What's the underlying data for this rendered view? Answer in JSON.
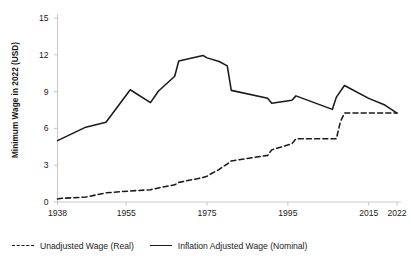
{
  "chart_data": {
    "type": "line",
    "title": "",
    "subtitle": "",
    "xlabel": "",
    "ylabel": "Minimum Wage in 2022 (USD)",
    "xlim": [
      1938,
      2022
    ],
    "ylim": [
      0,
      15
    ],
    "grid": false,
    "legend_position": "bottom-left",
    "x_tick_labels": [
      "1938",
      "1955",
      "1975",
      "1995",
      "2015",
      "2022"
    ],
    "x_tick_values": [
      1938,
      1955,
      1975,
      1995,
      2015,
      2022
    ],
    "y_tick_labels": [
      "0",
      "3",
      "6",
      "9",
      "12",
      "15"
    ],
    "y_tick_values": [
      0,
      3,
      6,
      9,
      12,
      15
    ],
    "series": [
      {
        "name": "Unadjusted Wage (Real)",
        "style": "dashed",
        "color": "#1a1a1a",
        "x": [
          1938,
          1939,
          1945,
          1950,
          1956,
          1961,
          1963,
          1967,
          1968,
          1974,
          1975,
          1976,
          1978,
          1979,
          1980,
          1981,
          1990,
          1991,
          1996,
          1997,
          2007,
          2008,
          2009,
          2022
        ],
        "values": [
          0.25,
          0.3,
          0.4,
          0.75,
          0.9,
          1.0,
          1.15,
          1.4,
          1.6,
          2.0,
          2.1,
          2.3,
          2.65,
          2.9,
          3.1,
          3.35,
          3.8,
          4.25,
          4.75,
          5.15,
          5.15,
          6.55,
          7.25,
          7.25
        ]
      },
      {
        "name": "Inflation Adjusted Wage (Nominal)",
        "style": "solid",
        "color": "#1a1a1a",
        "x": [
          1938,
          1945,
          1950,
          1956,
          1961,
          1963,
          1967,
          1968,
          1974,
          1975,
          1978,
          1980,
          1981,
          1990,
          1991,
          1996,
          1997,
          2006,
          2007,
          2009,
          2015,
          2019,
          2022
        ],
        "values": [
          5.0,
          6.1,
          6.5,
          9.15,
          8.1,
          9.05,
          10.25,
          11.5,
          11.95,
          11.75,
          11.45,
          11.1,
          9.1,
          8.45,
          8.05,
          8.3,
          8.65,
          7.55,
          8.55,
          9.5,
          8.45,
          7.9,
          7.25
        ]
      }
    ]
  },
  "legend": {
    "items": [
      {
        "label": "Unadjusted Wage (Real)",
        "style": "dashed"
      },
      {
        "label": "Inflation Adjusted Wage (Nominal)",
        "style": "solid"
      }
    ]
  },
  "axes": {
    "y_title": "Minimum Wage in 2022 (USD)",
    "axis_color": "#c9c9c9",
    "line_color": "#1a1a1a"
  }
}
